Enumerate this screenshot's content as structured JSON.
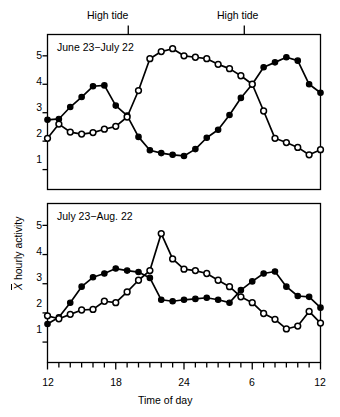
{
  "figure": {
    "width": 340,
    "height": 417,
    "background": "#ffffff",
    "ink_color": "#000000"
  },
  "annotations": {
    "high_tide_left": "High tide",
    "high_tide_right": "High tide"
  },
  "axis": {
    "y_title_symbol": "X",
    "y_title_rest": " hourly activity",
    "x_title": "Time of day",
    "x_tick_labels": [
      "12",
      "18",
      "24",
      "6",
      "12"
    ],
    "y_tick_labels_top": [
      "5",
      "4",
      "3",
      "2",
      "1"
    ],
    "y_tick_labels_bottom": [
      "5",
      "4",
      "3",
      "2",
      "1"
    ]
  },
  "chart_data": [
    {
      "type": "line",
      "title": "June 23−July 22",
      "xlabel": "Time of day",
      "ylabel": "X̄ hourly activity",
      "xlim": [
        12,
        36
      ],
      "ylim": [
        0.3,
        5.75
      ],
      "grid": false,
      "legend_position": "none",
      "x_tick_values": [
        12,
        18,
        24,
        30,
        36
      ],
      "x_tick_labels": [
        "12",
        "18",
        "24",
        "6",
        "12"
      ],
      "y_tick_values": [
        1,
        2,
        3,
        4,
        5
      ],
      "annotations": [
        {
          "label": "High tide",
          "x": 19.1
        },
        {
          "label": "High tide",
          "x": 29.3
        }
      ],
      "x": [
        12,
        13,
        14,
        15,
        16,
        17,
        18,
        19,
        20,
        21,
        22,
        23,
        24,
        25,
        26,
        27,
        28,
        29,
        30,
        31,
        32,
        33,
        34,
        35,
        36
      ],
      "series": [
        {
          "name": "filled-circle series",
          "marker": "filled-circle",
          "values": [
            2.75,
            2.78,
            3.2,
            3.55,
            3.93,
            3.96,
            3.25,
            2.9,
            2.15,
            1.68,
            1.58,
            1.52,
            1.48,
            1.72,
            2.12,
            2.4,
            2.92,
            3.52,
            4.0,
            4.6,
            4.77,
            4.95,
            4.83,
            4.0,
            3.7
          ]
        },
        {
          "name": "open-circle series",
          "marker": "open-circle",
          "values": [
            2.1,
            2.6,
            2.32,
            2.25,
            2.3,
            2.42,
            2.52,
            2.85,
            3.78,
            4.9,
            5.15,
            5.25,
            5.0,
            4.95,
            4.9,
            4.7,
            4.55,
            4.3,
            4.0,
            3.06,
            2.1,
            1.95,
            1.78,
            1.52,
            1.7
          ]
        }
      ]
    },
    {
      "type": "line",
      "title": "July 23−Aug. 22",
      "xlabel": "Time of day",
      "ylabel": "X̄ hourly activity",
      "xlim": [
        12,
        36
      ],
      "ylim": [
        0.3,
        5.75
      ],
      "grid": false,
      "legend_position": "none",
      "x_tick_values": [
        12,
        18,
        24,
        30,
        36
      ],
      "x_tick_labels": [
        "12",
        "18",
        "24",
        "6",
        "12"
      ],
      "y_tick_values": [
        1,
        2,
        3,
        4,
        5
      ],
      "x": [
        12,
        13,
        14,
        15,
        16,
        17,
        18,
        19,
        20,
        21,
        22,
        23,
        24,
        25,
        26,
        27,
        28,
        29,
        30,
        31,
        32,
        33,
        34,
        35,
        36
      ],
      "series": [
        {
          "name": "filled-circle series",
          "marker": "filled-circle",
          "values": [
            1.62,
            1.85,
            2.35,
            2.9,
            3.22,
            3.35,
            3.52,
            3.45,
            3.4,
            3.2,
            2.45,
            2.4,
            2.45,
            2.48,
            2.52,
            2.45,
            2.35,
            2.78,
            3.08,
            3.35,
            3.42,
            2.9,
            2.58,
            2.55,
            2.18
          ]
        },
        {
          "name": "open-circle series",
          "marker": "open-circle",
          "values": [
            1.9,
            1.8,
            1.95,
            2.1,
            2.12,
            2.4,
            2.35,
            2.72,
            3.12,
            3.45,
            4.72,
            3.85,
            3.5,
            3.45,
            3.35,
            3.12,
            2.9,
            2.55,
            2.35,
            1.98,
            1.78,
            1.45,
            1.55,
            2.05,
            1.65
          ]
        }
      ]
    }
  ]
}
